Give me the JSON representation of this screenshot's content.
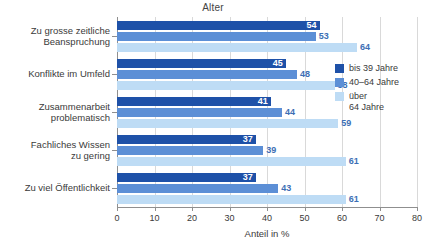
{
  "chart_data": {
    "type": "bar",
    "orientation": "horizontal",
    "title": "Alter",
    "xlabel": "Anteil in %",
    "ylabel": "",
    "xlim": [
      0,
      80
    ],
    "xticks": [
      0,
      10,
      20,
      30,
      40,
      50,
      60,
      70,
      80
    ],
    "grid": true,
    "legend_position": "right",
    "categories": [
      "Zu grosse zeitliche\nBeanspruchung",
      "Konflikte im Umfeld",
      "Zusammenarbeit\nproblematisch",
      "Fachliches Wissen\nzu gering",
      "Zu viel Öffentlichkeit"
    ],
    "series": [
      {
        "name": "bis 39 Jahre",
        "color": "#1e51a8",
        "values": [
          54,
          45,
          41,
          37,
          37
        ]
      },
      {
        "name": "40–64 Jahre",
        "color": "#5c8fd6",
        "values": [
          53,
          48,
          44,
          39,
          43
        ]
      },
      {
        "name": "über\n64 Jahre",
        "color": "#bedcf5",
        "values": [
          64,
          58,
          59,
          61,
          61
        ]
      }
    ]
  },
  "legend": {
    "items": [
      {
        "label": "bis 39 Jahre",
        "color": "#1e51a8"
      },
      {
        "label": "40–64 Jahre",
        "color": "#5c8fd6"
      },
      {
        "label": "über\n64 Jahre",
        "color": "#bedcf5"
      }
    ]
  },
  "axis": {
    "x_tick_labels": [
      "0",
      "10",
      "20",
      "30",
      "40",
      "50",
      "60",
      "70",
      "80"
    ],
    "x_label": "Anteil in %"
  },
  "colors": {
    "series_1": "#1e51a8",
    "series_2": "#5c8fd6",
    "series_3": "#bedcf5",
    "grid": "#d9d9d9",
    "axis": "#8f8f8f",
    "text": "#3a3a3a",
    "value_outside": "#3c6fb5"
  }
}
